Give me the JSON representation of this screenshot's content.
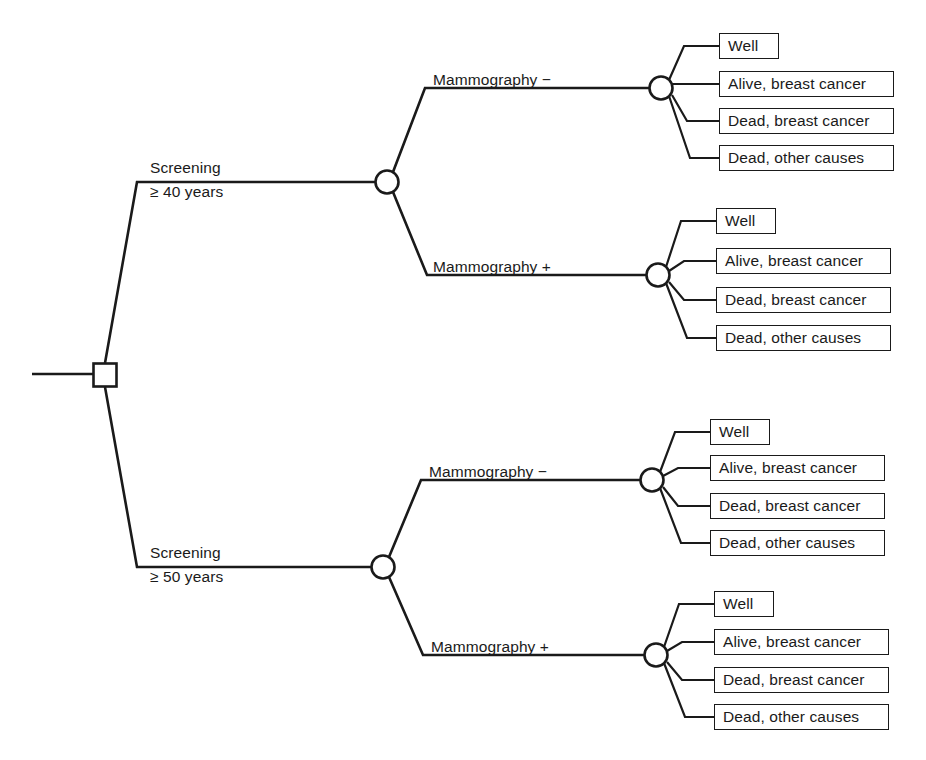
{
  "diagram": {
    "type": "decision-tree",
    "title": "",
    "root": {
      "node_type": "decision",
      "shape": "square"
    },
    "strategies": [
      {
        "id": "screening-40",
        "label_line1": "Screening",
        "label_line2": "≥ 40 years",
        "node_type": "chance",
        "branches": [
          {
            "id": "mammography-negative-40",
            "label": "Mammography −",
            "node_type": "chance",
            "outcomes": [
              "Well",
              "Alive, breast cancer",
              "Dead, breast cancer",
              "Dead, other causes"
            ]
          },
          {
            "id": "mammography-positive-40",
            "label": "Mammography +",
            "node_type": "chance",
            "outcomes": [
              "Well",
              "Alive, breast cancer",
              "Dead, breast cancer",
              "Dead, other causes"
            ]
          }
        ]
      },
      {
        "id": "screening-50",
        "label_line1": "Screening",
        "label_line2": "≥ 50 years",
        "node_type": "chance",
        "branches": [
          {
            "id": "mammography-negative-50",
            "label": "Mammography −",
            "node_type": "chance",
            "outcomes": [
              "Well",
              "Alive, breast cancer",
              "Dead, breast cancer",
              "Dead, other causes"
            ]
          },
          {
            "id": "mammography-positive-50",
            "label": "Mammography +",
            "node_type": "chance",
            "outcomes": [
              "Well",
              "Alive, breast cancer",
              "Dead, breast cancer",
              "Dead, other causes"
            ]
          }
        ]
      }
    ],
    "colors": {
      "line": "#1a1a1a",
      "box_fill": "#ffffff",
      "background": "#ffffff",
      "text": "#1a1a1a"
    }
  }
}
